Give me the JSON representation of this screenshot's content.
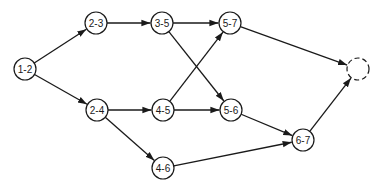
{
  "diagram": {
    "type": "activity-network",
    "nodes": [
      {
        "id": "1-2",
        "label": "1-2",
        "x": 25,
        "y": 69
      },
      {
        "id": "2-3",
        "label": "2-3",
        "x": 96,
        "y": 23
      },
      {
        "id": "3-5",
        "label": "3-5",
        "x": 162,
        "y": 23
      },
      {
        "id": "5-7",
        "label": "5-7",
        "x": 230,
        "y": 23
      },
      {
        "id": "end",
        "label": "",
        "x": 358,
        "y": 69,
        "dashed": true
      },
      {
        "id": "2-4",
        "label": "2-4",
        "x": 97,
        "y": 110
      },
      {
        "id": "4-5",
        "label": "4-5",
        "x": 163,
        "y": 110
      },
      {
        "id": "5-6",
        "label": "5-6",
        "x": 231,
        "y": 110
      },
      {
        "id": "4-6",
        "label": "4-6",
        "x": 163,
        "y": 168
      },
      {
        "id": "6-7",
        "label": "6-7",
        "x": 303,
        "y": 140
      }
    ],
    "edges": [
      {
        "from": "1-2",
        "to": "2-3"
      },
      {
        "from": "1-2",
        "to": "2-4"
      },
      {
        "from": "2-3",
        "to": "3-5"
      },
      {
        "from": "3-5",
        "to": "5-7"
      },
      {
        "from": "3-5",
        "to": "5-6"
      },
      {
        "from": "2-4",
        "to": "4-5"
      },
      {
        "from": "2-4",
        "to": "4-6"
      },
      {
        "from": "4-5",
        "to": "5-7"
      },
      {
        "from": "4-5",
        "to": "5-6"
      },
      {
        "from": "5-7",
        "to": "end"
      },
      {
        "from": "5-6",
        "to": "6-7"
      },
      {
        "from": "4-6",
        "to": "6-7"
      },
      {
        "from": "6-7",
        "to": "end"
      }
    ],
    "node_radius": 11
  }
}
